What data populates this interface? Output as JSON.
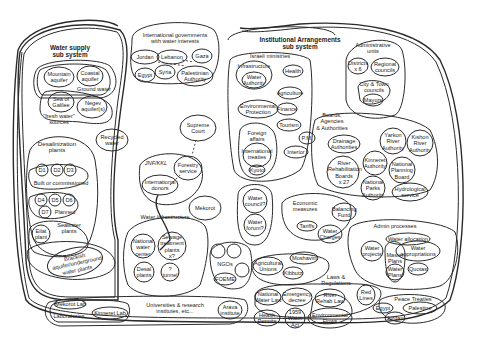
{
  "water_supply": {
    "title_line1": "Water supply",
    "title_line2": "sub system",
    "mountain": "Mountain",
    "mountain2": "aquifer",
    "coastal": "Coastal",
    "coastal2": "aquifer",
    "ground_water": "Ground water",
    "galilee": "Sea of",
    "galilee2": "Galilee",
    "negev": "Negev",
    "negev2": "aquifer(s)",
    "fresh": "\"fresh water\"",
    "fresh2": "sources",
    "recycled": "Recycled",
    "recycled2": "water",
    "desal_title": "Desalinization",
    "desal_title2": "plants",
    "d1": "D1",
    "d2": "D2",
    "d3": "D3",
    "built": "Built or commissioned",
    "d4": "D4",
    "d5": "D5",
    "d6": "D6",
    "d7": "D7",
    "planned": "Planned",
    "eilat": "Eilat",
    "eilat2": "plant",
    "seawater": "Seawater",
    "seawater2": "plants",
    "brackish": "Brackish",
    "brackish2": "aquifer/underground",
    "brackish3": "water plants"
  },
  "international": {
    "title": "International governments",
    "title2": "with water interests",
    "jordan": "Jordan",
    "lebanon": "Lebanon",
    "gaza": "Gaza",
    "egypt": "Egypt",
    "syria": "Syria",
    "pa": "Palestinian",
    "pa2": "Authority"
  },
  "middle": {
    "supreme": "Supreme",
    "supreme2": "Court",
    "jnf": "JNF/KKL",
    "forestry": "Forestry",
    "forestry2": "service",
    "donors": "International",
    "donors2": "donors",
    "mekorot": "Mekorot",
    "infra_title": "Water Infrastructure",
    "national_center": "National",
    "national_center2": "water",
    "national_center3": "center",
    "sewage": "Sewage",
    "sewage2": "treatment",
    "sewage3": "plants",
    "sewage4": "x?",
    "desal_plants": "Desal",
    "desal_plants2": "plants",
    "tunnel": "?",
    "tunnel2": "tunnel",
    "ngos": "NGOs",
    "foeme": "FOEME",
    "water_council": "Water",
    "water_council2": "council?",
    "water_forum": "Water",
    "water_forum2": "forum?"
  },
  "institutional": {
    "title": "Institutional Arrangements",
    "title2": "sub system",
    "ministries": "Israeli ministries",
    "infrastructure": "Infrastructure",
    "water_authority": "Water",
    "water_authority2": "Authority",
    "health": "Health",
    "agriculture": "Agriculture",
    "env": "Environmental",
    "env2": "Protection",
    "finance": "Finance",
    "tourism": "Tourism",
    "foreign": "Foreign",
    "foreign2": "affairs",
    "treaties": "International",
    "treaties2": "treaties",
    "kyoto": "Kyoto",
    "pm": "P.M.",
    "interior": "Interior",
    "admin_units": "Administrative",
    "admin_units2": "units",
    "districts": "Districts",
    "districts2": "x 6",
    "regional": "Regional",
    "regional2": "councils",
    "city": "City & Town",
    "city2": "councils",
    "mayors": "Mayors",
    "boards": "Boards,",
    "boards2": "Agencies",
    "boards3": "& Authorities",
    "drainage": "Drainage",
    "drainage2": "Authorities",
    "yarkon": "Yarkon",
    "yarkon2": "River",
    "yarkon3": "Authority",
    "kishon": "Kishon",
    "kishon2": "River",
    "kishon3": "Authority",
    "river_rehab": "River",
    "river_rehab2": "Rehabilitation",
    "river_rehab3": "Boards",
    "river_rehab4": "x 27",
    "kinneret": "Kinneret",
    "kinneret2": "Authority",
    "npb": "National",
    "npb2": "Planning",
    "npb3": "Board",
    "parks": "National",
    "parks2": "Parks",
    "parks3": "Authority",
    "hydro": "Hydrological",
    "hydro2": "service",
    "economic": "Economic",
    "economic2": "measures",
    "balancing": "Balancing",
    "balancing2": "Fund",
    "tariffs": "Tariffs",
    "charges": "Water",
    "charges2": "Charges",
    "admin_proc": "Admin processes",
    "allocation": "Water allocation",
    "appropriations": "Water",
    "appropriations2": "appropriations",
    "projects": "Water",
    "projects2": "projects",
    "master": "Master",
    "master2": "Plans",
    "wplans": "Water",
    "wplans2": "Plans",
    "quotas": "Quotas",
    "agri_unions": "Agricultural",
    "agri_unions2": "Unions",
    "moshavim": "Moshavim",
    "kibbutz": "Kibbutz",
    "laws": "Laws &",
    "laws2": "Regulations",
    "nwl": "National",
    "nwl2": "Water Law",
    "emergency": "Emergency",
    "emergency2": "decree",
    "river_law": "River",
    "river_law2": "Rehab Law",
    "red_lines": "Red",
    "red_lines2": "Lines",
    "health_permits": "Health",
    "health_permits2": "Permits",
    "act": "1959",
    "act2": "Water",
    "act3": "Act",
    "env_flows": "Environmental",
    "env_flows2": "Flows",
    "peace": "Peace Treaties",
    "egypt": "Egypt",
    "palestine": "Palestine",
    "jordan": "Jordan"
  },
  "research": {
    "mekorot_lab": "Mekorot Lab",
    "labs": "Laboratories",
    "kinneret_lab": "Kinneret Lab",
    "universities": "Universities & research",
    "universities2": "institutes, etc...",
    "arava": "Arava",
    "arava2": "institute"
  }
}
